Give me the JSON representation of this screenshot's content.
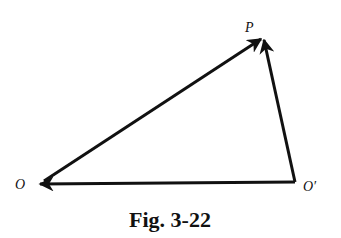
{
  "figure": {
    "caption": "Fig. 3-22",
    "points": {
      "O": {
        "label": "O",
        "x": 40,
        "y": 183
      },
      "O_prime": {
        "label": "O′",
        "x": 295,
        "y": 182
      },
      "P": {
        "label": "P",
        "x": 263,
        "y": 37
      }
    },
    "vectors": [
      {
        "from": "O",
        "to": "P",
        "name": "OP"
      },
      {
        "from": "O_prime",
        "to": "P",
        "name": "O'P"
      },
      {
        "from": "O_prime",
        "to": "O",
        "name": "O'O"
      }
    ],
    "colors": {
      "stroke": "#111111",
      "background": "#ffffff"
    }
  }
}
